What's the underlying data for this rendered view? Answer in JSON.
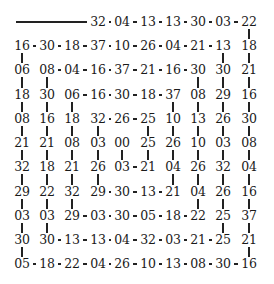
{
  "layout": {
    "cols_x": [
      22,
      47,
      72,
      98,
      122,
      148,
      173,
      198,
      223,
      249
    ],
    "rows_y": [
      22,
      46,
      70,
      95,
      119,
      143,
      167,
      192,
      216,
      240,
      264
    ]
  },
  "start_line": {
    "x1": 16,
    "x2": 88,
    "row": 0
  },
  "grid": [
    [
      null,
      null,
      null,
      "32",
      "04",
      "13",
      "13",
      "30",
      "03",
      "22"
    ],
    [
      "16",
      "30",
      "18",
      "37",
      "10",
      "26",
      "04",
      "21",
      "13",
      "18"
    ],
    [
      "06",
      "08",
      "04",
      "16",
      "37",
      "21",
      "16",
      "30",
      "30",
      "21"
    ],
    [
      "18",
      "30",
      "06",
      "16",
      "30",
      "18",
      "37",
      "08",
      "29",
      "16"
    ],
    [
      "08",
      "16",
      "18",
      "32",
      "26",
      "25",
      "10",
      "13",
      "26",
      "30"
    ],
    [
      "21",
      "21",
      "08",
      "03",
      "00",
      "25",
      "26",
      "10",
      "03",
      "08"
    ],
    [
      "32",
      "18",
      "21",
      "26",
      "03",
      "21",
      "04",
      "26",
      "32",
      "04"
    ],
    [
      "29",
      "22",
      "32",
      "29",
      "30",
      "13",
      "21",
      "04",
      "26",
      "16"
    ],
    [
      "03",
      "03",
      "29",
      "03",
      "30",
      "05",
      "18",
      "22",
      "25",
      "37"
    ],
    [
      "30",
      "30",
      "13",
      "13",
      "04",
      "32",
      "03",
      "21",
      "25",
      "21"
    ],
    [
      "05",
      "18",
      "22",
      "04",
      "26",
      "10",
      "13",
      "08",
      "30",
      "16"
    ]
  ],
  "h_edges": [
    [
      0,
      3
    ],
    [
      0,
      4
    ],
    [
      0,
      5
    ],
    [
      0,
      6
    ],
    [
      0,
      7
    ],
    [
      0,
      8
    ],
    [
      1,
      0
    ],
    [
      1,
      1
    ],
    [
      1,
      2
    ],
    [
      1,
      3
    ],
    [
      1,
      4
    ],
    [
      1,
      5
    ],
    [
      1,
      6
    ],
    [
      1,
      7
    ],
    [
      2,
      1
    ],
    [
      2,
      2
    ],
    [
      2,
      3
    ],
    [
      2,
      4
    ],
    [
      2,
      5
    ],
    [
      2,
      6
    ],
    [
      3,
      2
    ],
    [
      3,
      3
    ],
    [
      3,
      4
    ],
    [
      3,
      5
    ],
    [
      4,
      3
    ],
    [
      4,
      4
    ],
    [
      6,
      4
    ],
    [
      7,
      3
    ],
    [
      7,
      4
    ],
    [
      7,
      5
    ],
    [
      8,
      2
    ],
    [
      8,
      3
    ],
    [
      8,
      4
    ],
    [
      8,
      5
    ],
    [
      8,
      6
    ],
    [
      9,
      1
    ],
    [
      9,
      2
    ],
    [
      9,
      3
    ],
    [
      9,
      4
    ],
    [
      9,
      5
    ],
    [
      9,
      6
    ],
    [
      9,
      7
    ],
    [
      10,
      0
    ],
    [
      10,
      1
    ],
    [
      10,
      2
    ],
    [
      10,
      3
    ],
    [
      10,
      4
    ],
    [
      10,
      5
    ],
    [
      10,
      6
    ],
    [
      10,
      7
    ],
    [
      10,
      8
    ]
  ],
  "v_edges": [
    [
      0,
      9
    ],
    [
      1,
      9
    ],
    [
      2,
      9
    ],
    [
      3,
      9
    ],
    [
      4,
      9
    ],
    [
      5,
      9
    ],
    [
      6,
      9
    ],
    [
      7,
      9
    ],
    [
      8,
      9
    ],
    [
      9,
      9
    ],
    [
      1,
      0
    ],
    [
      2,
      0
    ],
    [
      3,
      0
    ],
    [
      4,
      0
    ],
    [
      5,
      0
    ],
    [
      6,
      0
    ],
    [
      7,
      0
    ],
    [
      8,
      0
    ],
    [
      9,
      0
    ],
    [
      1,
      8
    ],
    [
      2,
      8
    ],
    [
      3,
      8
    ],
    [
      4,
      8
    ],
    [
      5,
      8
    ],
    [
      6,
      8
    ],
    [
      7,
      8
    ],
    [
      8,
      8
    ],
    [
      2,
      1
    ],
    [
      3,
      1
    ],
    [
      4,
      1
    ],
    [
      5,
      1
    ],
    [
      6,
      1
    ],
    [
      7,
      1
    ],
    [
      8,
      1
    ],
    [
      2,
      7
    ],
    [
      3,
      7
    ],
    [
      4,
      7
    ],
    [
      5,
      7
    ],
    [
      6,
      7
    ],
    [
      7,
      7
    ],
    [
      3,
      2
    ],
    [
      4,
      2
    ],
    [
      5,
      2
    ],
    [
      6,
      2
    ],
    [
      7,
      2
    ],
    [
      3,
      6
    ],
    [
      4,
      6
    ],
    [
      5,
      6
    ],
    [
      6,
      6
    ],
    [
      4,
      3
    ],
    [
      5,
      3
    ],
    [
      6,
      3
    ],
    [
      4,
      5
    ],
    [
      5,
      5
    ],
    [
      5,
      4
    ]
  ]
}
